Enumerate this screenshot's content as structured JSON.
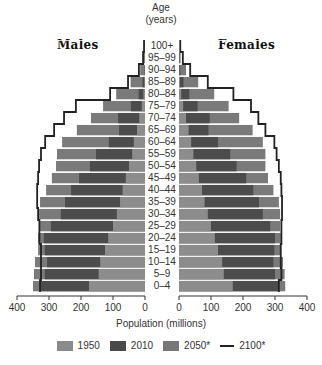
{
  "chart_data": {
    "type": "bar",
    "subtype": "population-pyramid",
    "title": "",
    "y_axis_title": "Age (years)",
    "xlabel": "Population (millions)",
    "left_label": "Males",
    "right_label": "Females",
    "xlim": [
      0,
      400
    ],
    "x_ticks": [
      0,
      100,
      200,
      300,
      400
    ],
    "categories": [
      "0–4",
      "5–9",
      "10–14",
      "15–19",
      "20–24",
      "25–29",
      "30–34",
      "35–39",
      "40–44",
      "45–49",
      "50–54",
      "55–59",
      "60–64",
      "65–69",
      "70–74",
      "75–79",
      "80–84",
      "85–89",
      "90–94",
      "95–99",
      "100+"
    ],
    "series": [
      {
        "name": "1950",
        "type": "bar",
        "color": "#8a8a8a",
        "males": [
          175,
          145,
          140,
          125,
          115,
          100,
          88,
          78,
          70,
          60,
          50,
          40,
          35,
          25,
          18,
          10,
          5,
          2,
          1,
          0,
          0
        ],
        "females": [
          168,
          140,
          135,
          122,
          112,
          100,
          90,
          80,
          72,
          62,
          54,
          45,
          38,
          30,
          22,
          13,
          7,
          3,
          1,
          0,
          0
        ]
      },
      {
        "name": "2010",
        "type": "bar",
        "color": "#4a4a4a",
        "males": [
          328,
          313,
          306,
          313,
          316,
          294,
          263,
          250,
          231,
          206,
          172,
          153,
          113,
          81,
          84,
          44,
          20,
          8,
          2,
          0,
          0
        ],
        "females": [
          310,
          300,
          295,
          298,
          300,
          285,
          262,
          250,
          232,
          210,
          180,
          160,
          122,
          92,
          96,
          58,
          32,
          14,
          4,
          1,
          0
        ],
        "note": "values read from outer edge of dark bar"
      },
      {
        "name": "2050*",
        "type": "bar",
        "color": "#777777",
        "males": [
          350,
          347,
          344,
          334,
          334,
          331,
          331,
          328,
          309,
          291,
          278,
          275,
          259,
          213,
          169,
          131,
          90,
          45,
          15,
          3,
          0
        ],
        "females": [
          332,
          330,
          325,
          318,
          318,
          316,
          316,
          312,
          295,
          278,
          270,
          270,
          262,
          230,
          188,
          155,
          110,
          60,
          22,
          5,
          0
        ]
      },
      {
        "name": "2100*",
        "type": "line",
        "color": "#222222",
        "males": [
          328,
          325,
          325,
          325,
          330,
          330,
          334,
          337,
          337,
          334,
          331,
          325,
          312,
          284,
          253,
          216,
          109,
          53,
          19,
          6,
          3
        ],
        "females": [
          312,
          320,
          318,
          318,
          320,
          320,
          322,
          322,
          320,
          318,
          312,
          305,
          298,
          270,
          248,
          225,
          170,
          90,
          35,
          12,
          4
        ]
      }
    ],
    "legend": [
      "1950",
      "2010",
      "2050*",
      "2100*"
    ],
    "legend_position": "bottom",
    "grid": false
  },
  "labels": {
    "age_title_line1": "Age",
    "age_title_line2": "(years)",
    "males": "Males",
    "females": "Females",
    "xlabel": "Population (millions)"
  },
  "left_ticks": [
    "400",
    "300",
    "200",
    "100",
    "0"
  ],
  "right_ticks": [
    "0",
    "100",
    "200",
    "300",
    "400"
  ],
  "legend": {
    "item_1950": "1950",
    "item_2010": "2010",
    "item_2050": "2050*",
    "item_2100": "2100*"
  }
}
